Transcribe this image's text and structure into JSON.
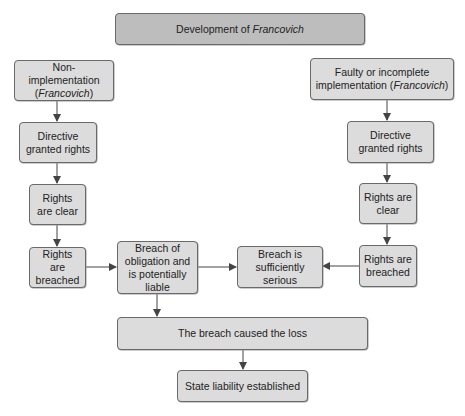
{
  "diagram": {
    "title": {
      "text": "Development of ",
      "italic": "Francovich"
    },
    "left_branch": {
      "start": {
        "text": "Non-implementation",
        "italic": "Francovich"
      },
      "directive": "Directive granted rights",
      "clear": "Rights are clear",
      "breached": "Rights are breached"
    },
    "right_branch": {
      "start": {
        "text": "Faulty or incomplete implementation",
        "italic": "Francovich"
      },
      "directive": "Directive granted rights",
      "clear": "Rights are clear",
      "breached": "Rights are breached"
    },
    "breach_obligation": "Breach of obligation and is potentially liable",
    "sufficiently_serious": "Breach is sufficiently serious",
    "caused_loss": "The breach caused the loss",
    "liability": "State liability established"
  },
  "colors": {
    "header_fill": "#bdbdbd",
    "box_fill": "#dcdcdc",
    "border": "#6a6a6a",
    "arrow": "#444444"
  }
}
